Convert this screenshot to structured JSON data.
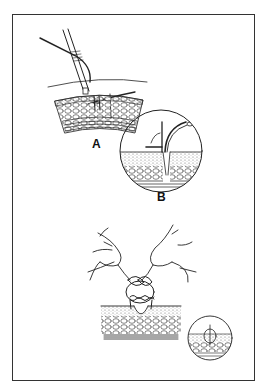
{
  "figure": {
    "header_fragment": "",
    "panels": [
      {
        "id": "A",
        "label": "A",
        "description": "needle holder passing curved needle through skin layers"
      },
      {
        "id": "B",
        "label": "B",
        "description": "magnified circular inset of needle entering skin"
      },
      {
        "id": "C",
        "label": "",
        "description": "hands tying surgical knot over tissue with small inset showing completed suture"
      }
    ],
    "colors": {
      "ink": "#222222",
      "frame": "#333333",
      "background": "#ffffff"
    }
  }
}
